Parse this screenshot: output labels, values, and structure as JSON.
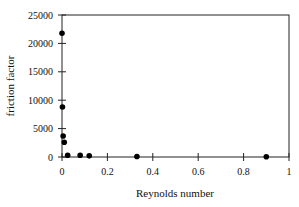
{
  "chart_data": {
    "type": "scatter",
    "title": "",
    "xlabel": "Reynolds number",
    "ylabel": "friction factor",
    "xlim": [
      0,
      1
    ],
    "ylim": [
      0,
      25000
    ],
    "xticks": [
      0,
      0.2,
      0.4,
      0.6,
      0.8,
      1
    ],
    "xtick_labels": [
      "0",
      "0.2",
      "0.4",
      "0.6",
      "0.8",
      "1"
    ],
    "yticks": [
      0,
      5000,
      10000,
      15000,
      20000,
      25000
    ],
    "ytick_labels": [
      "0",
      "5000",
      "10000",
      "15000",
      "20000",
      "25000"
    ],
    "grid": false,
    "legend": null,
    "series": [
      {
        "name": "data",
        "marker": "filled-circle",
        "color": "#000000",
        "x": [
          0.0,
          0.002,
          0.005,
          0.01,
          0.025,
          0.08,
          0.12,
          0.33,
          0.9
        ],
        "y": [
          21800,
          8800,
          3700,
          2600,
          300,
          300,
          200,
          100,
          50
        ]
      }
    ]
  }
}
